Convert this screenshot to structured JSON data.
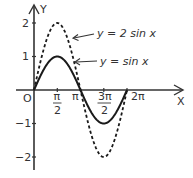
{
  "chart_data": {
    "type": "line",
    "title": "",
    "xlabel": "X",
    "ylabel": "Y",
    "origin_label": "O",
    "x_range": [
      0,
      6.2832
    ],
    "y_range": [
      -2,
      2
    ],
    "xlim": [
      -1.2,
      10.0
    ],
    "ylim": [
      -2.4,
      2.6
    ],
    "grid": false,
    "x_ticks": [
      {
        "value": 1.5708,
        "label_top": "π",
        "label_bottom": "2",
        "fraction": true
      },
      {
        "value": 3.1416,
        "label": "π",
        "fraction": false
      },
      {
        "value": 4.7124,
        "label_top": "3π",
        "label_bottom": "2",
        "fraction": true
      },
      {
        "value": 6.2832,
        "label": "2π",
        "fraction": false
      }
    ],
    "y_ticks": [
      {
        "value": 2,
        "label": "2"
      },
      {
        "value": 1,
        "label": "1"
      },
      {
        "value": -1,
        "label": "−1"
      },
      {
        "value": -2,
        "label": "−2"
      }
    ],
    "series": [
      {
        "name": "y = 2 sin x",
        "style": "dashed",
        "amplitude": 2,
        "color": "#1a1a1a",
        "points": [
          [
            0,
            0
          ],
          [
            1.5708,
            2
          ],
          [
            3.1416,
            0
          ],
          [
            4.7124,
            -2
          ],
          [
            6.2832,
            0
          ]
        ]
      },
      {
        "name": "y = sin x",
        "style": "solid",
        "amplitude": 1,
        "color": "#1a1a1a",
        "points": [
          [
            0,
            0
          ],
          [
            1.5708,
            1
          ],
          [
            3.1416,
            0
          ],
          [
            4.7124,
            -1
          ],
          [
            6.2832,
            0
          ]
        ]
      }
    ],
    "annotations": [
      {
        "text": "y = 2 sin x",
        "points_to": "dashed curve",
        "arrow": true
      },
      {
        "text": "y = sin x",
        "points_to": "solid curve",
        "arrow": true
      }
    ],
    "legend": "none (arrow annotations)"
  },
  "labels": {
    "x_axis": "X",
    "y_axis": "Y",
    "origin": "O",
    "tick_pi_half_top": "π",
    "tick_pi_half_bottom": "2",
    "tick_pi": "π",
    "tick_3pi_half_top": "3π",
    "tick_3pi_half_bottom": "2",
    "tick_2pi": "2π",
    "y2": "2",
    "y1": "1",
    "yneg1": "−1",
    "yneg2": "−2",
    "eq_dashed": "y = 2 sin x",
    "eq_solid": "y = sin x"
  },
  "colors": {
    "curve": "#1a1a1a",
    "axis": "#333333",
    "background": "#ffffff"
  }
}
